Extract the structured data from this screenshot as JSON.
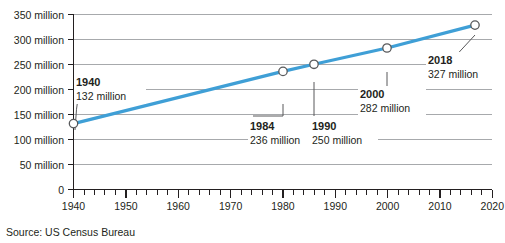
{
  "source_note": "Source: US Census Bureau",
  "chart_data": {
    "type": "line",
    "title": "",
    "xlabel": "",
    "ylabel": "",
    "xlim": [
      1940,
      2020
    ],
    "ylim": [
      0,
      350
    ],
    "grid": true,
    "legend": "none",
    "units": "million",
    "line_color": "#3f9fd6",
    "marker_fill": "#ffffff",
    "marker_stroke": "#58595b",
    "grid_color": "#a7a9ac",
    "axis_color": "#231f20",
    "x_ticks": [
      1940,
      1950,
      1960,
      1970,
      1980,
      1990,
      2000,
      2010,
      2020
    ],
    "x_tick_labels": [
      "1940",
      "1950",
      "1960",
      "1970",
      "1980",
      "1990",
      "2000",
      "2010",
      "2020"
    ],
    "x_minor_tick_step": 2,
    "y_ticks": [
      0,
      50,
      100,
      150,
      200,
      250,
      300,
      350
    ],
    "y_tick_labels": [
      "0",
      "50 million",
      "100 million",
      "150 million",
      "200 million",
      "250 million",
      "300 million",
      "350 million"
    ],
    "x": [
      1940,
      1984,
      1990,
      2000,
      2018
    ],
    "values": [
      132,
      236,
      250,
      282,
      327
    ],
    "points": [
      {
        "year": 1940,
        "value": 132,
        "year_label": "1940",
        "value_label": "132 million"
      },
      {
        "year": 1984,
        "value": 236,
        "year_label": "1984",
        "value_label": "236 million"
      },
      {
        "year": 1990,
        "value": 250,
        "year_label": "1990",
        "value_label": "250 million"
      },
      {
        "year": 2000,
        "value": 282,
        "year_label": "2000",
        "value_label": "282 million"
      },
      {
        "year": 2018,
        "value": 327,
        "year_label": "2018",
        "value_label": "327 million"
      }
    ],
    "annotations": [
      {
        "year_label": "1940",
        "value_label": "132 million"
      },
      {
        "year_label": "1984",
        "value_label": "236 million"
      },
      {
        "year_label": "1990",
        "value_label": "250 million"
      },
      {
        "year_label": "2000",
        "value_label": "282 million"
      },
      {
        "year_label": "2018",
        "value_label": "327 million"
      }
    ]
  }
}
